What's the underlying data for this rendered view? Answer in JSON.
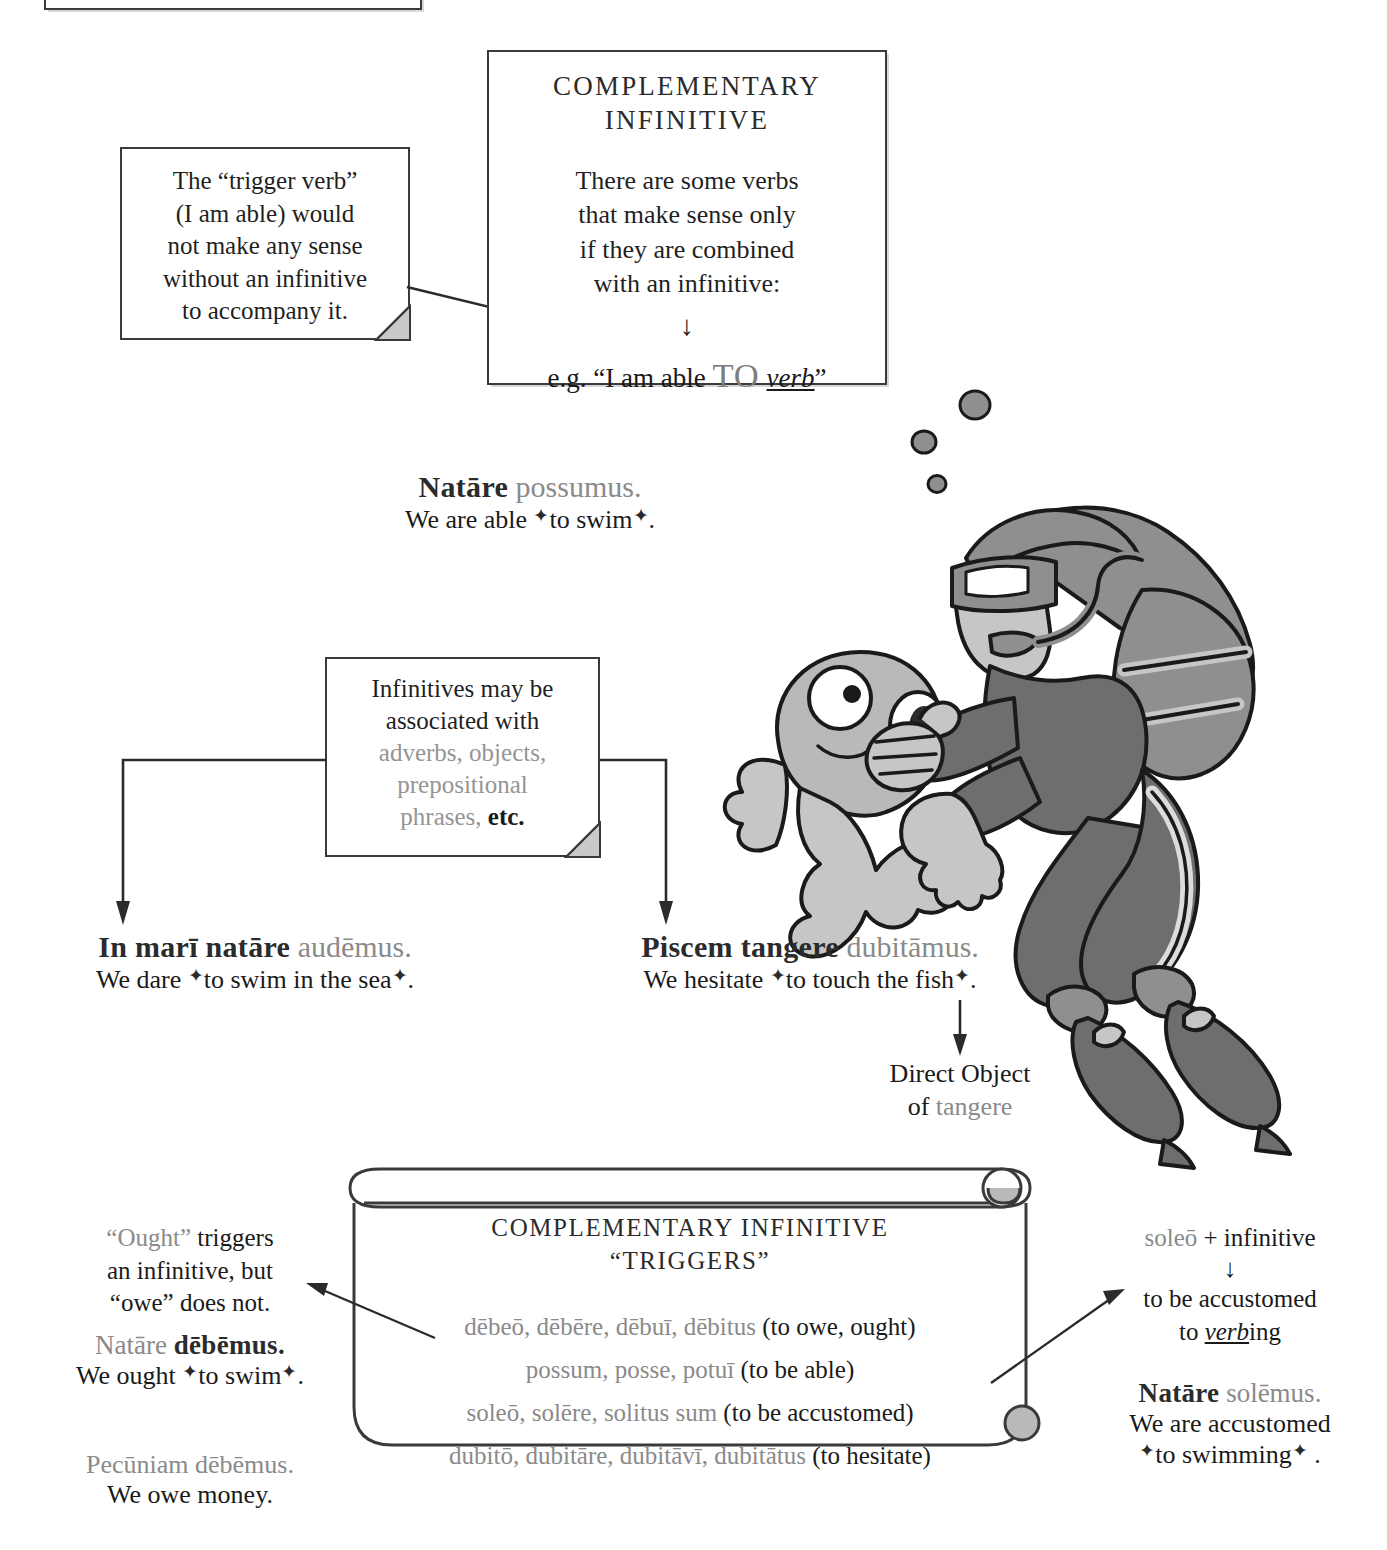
{
  "page": {
    "topbox_partial": {
      "note": "cut-off box edge from preceding content"
    }
  },
  "trigger_note": {
    "lines": [
      "The “trigger verb”",
      "(I am able) would",
      "not make any sense",
      "without an infinitive",
      "to accompany it."
    ]
  },
  "main_box": {
    "title_line1": "COMPLEMENTARY",
    "title_line2": "INFINITIVE",
    "body_lines": [
      "There are some verbs",
      "that make sense only",
      "if they are combined",
      "with an infinitive:"
    ],
    "arrow_glyph": "↓",
    "example_prefix": "e.g. “I am able ",
    "example_to": "TO",
    "example_verb": "verb",
    "example_suffix": "”"
  },
  "examples": {
    "swim": {
      "latin_bold": "Natāre",
      "latin_rest": " possumus.",
      "english_pre": "We are able ",
      "english_marked": "to swim",
      "english_post": "."
    },
    "sea": {
      "latin_bold": "In marī natāre",
      "latin_rest": " audēmus.",
      "english_pre": "We dare ",
      "english_marked": "to swim in the sea",
      "english_post": "."
    },
    "fish": {
      "latin_bold": "Piscem tangere",
      "latin_rest": " dubitāmus.",
      "english_pre": "We hesitate ",
      "english_marked": "to touch the fish",
      "english_post": "."
    }
  },
  "infinitives_note": {
    "line1": "Infinitives may be",
    "line2": "associated with",
    "gray_line1": "adverbs, objects,",
    "gray_line2": "prepositional",
    "gray_line3": "phrases,",
    "tail": " etc."
  },
  "direct_object_label": {
    "line1": "Direct Object",
    "line2_prefix": "of ",
    "line2_latin": "tangere"
  },
  "scroll": {
    "title_line1": "COMPLEMENTARY INFINITIVE",
    "title_line2": "“TRIGGERS”",
    "entries": [
      {
        "latin": "dēbeō, dēbēre, dēbuī, dēbitus",
        "gloss": "(to owe, ought)"
      },
      {
        "latin": "possum, posse, potuī",
        "gloss": "(to be able)"
      },
      {
        "latin": "soleō, solēre, solitus sum",
        "gloss": "(to be accustomed)"
      },
      {
        "latin": "dubitō, dubitāre, dubitāvī, dubitātus",
        "gloss": "(to hesitate)"
      }
    ]
  },
  "left_commentary": {
    "note_l1_gray": "“Ought”",
    "note_l1_rest": " triggers",
    "note_l2": "an infinitive, but",
    "note_l3": "“owe” does not.",
    "ex1_latin_gray": "Natāre ",
    "ex1_latin_bold": "dēbēmus.",
    "ex1_eng_pre": "We ought ",
    "ex1_eng_marked": "to swim",
    "ex1_eng_post": ".",
    "ex2_latin": "Pecūniam dēbēmus.",
    "ex2_eng": "We owe money."
  },
  "right_commentary": {
    "head_gray": "soleō",
    "head_rest": " + infinitive",
    "arrow_glyph": "↓",
    "gloss_l1": "to be accustomed",
    "gloss_l2_pre": "to ",
    "gloss_l2_verb": "verb",
    "gloss_l2_post": "ing",
    "ex_latin_bold": "Natāre",
    "ex_latin_rest": " solēmus.",
    "ex_eng_l1": "We are accustomed",
    "ex_eng_marked": "to swimming",
    "ex_eng_post": " ."
  },
  "illustration": {
    "diver": "scuba-diver",
    "fish": "surprised-fish",
    "bubbles": 3
  },
  "colors": {
    "ink": "#1a1a1a",
    "gray_text": "#8a8a8a",
    "rule": "#3a3a3a",
    "suit_dark": "#6e6e6e",
    "suit_mid": "#8f8f8f",
    "suit_light": "#c6c6c6"
  }
}
